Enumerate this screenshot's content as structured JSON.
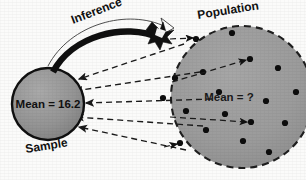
{
  "diagram": {
    "background_color": "#fbfbfa"
  },
  "sample": {
    "caption": "Sample",
    "mean_label": "Mean = 16.2",
    "fill_color": "#8f8f8f",
    "stroke_color": "#111111",
    "cx": 48,
    "cy": 104,
    "r": 36
  },
  "population": {
    "caption": "Population",
    "mean_label": "Mean = ?",
    "fill_color": "#9a9a9a",
    "stroke_color": "#1a1a1a",
    "border_style": "dashed",
    "cx": 242,
    "cy": 97,
    "r": 71,
    "dots": [
      {
        "x": 196,
        "y": 39
      },
      {
        "x": 232,
        "y": 33
      },
      {
        "x": 203,
        "y": 72
      },
      {
        "x": 175,
        "y": 78
      },
      {
        "x": 250,
        "y": 59
      },
      {
        "x": 219,
        "y": 92
      },
      {
        "x": 278,
        "y": 68
      },
      {
        "x": 296,
        "y": 92
      },
      {
        "x": 266,
        "y": 101
      },
      {
        "x": 186,
        "y": 111
      },
      {
        "x": 225,
        "y": 114
      },
      {
        "x": 251,
        "y": 122
      },
      {
        "x": 285,
        "y": 123
      },
      {
        "x": 206,
        "y": 130
      },
      {
        "x": 243,
        "y": 141
      },
      {
        "x": 269,
        "y": 152
      },
      {
        "x": 180,
        "y": 143
      },
      {
        "x": 163,
        "y": 98
      },
      {
        "x": 197,
        "y": 45
      }
    ]
  },
  "inference": {
    "label": "Inference",
    "arrow_color": "#101010",
    "direction": "sample-to-population"
  },
  "sampling_arrows": {
    "count": 5,
    "style": "dashed",
    "direction": "population-to-sample",
    "color": "#1a1a1a"
  }
}
